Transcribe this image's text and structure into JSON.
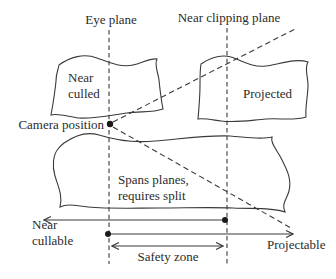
{
  "colors": {
    "background": "#ffffff",
    "line": "#3a3a3a",
    "text": "#2b2b2b"
  },
  "planes": {
    "eye": {
      "label": "Eye plane"
    },
    "near_clipping": {
      "label": "Near clipping plane"
    }
  },
  "camera": {
    "label": "Camera position"
  },
  "regions": {
    "near_culled": {
      "lines": [
        "Near",
        "culled"
      ]
    },
    "projected": {
      "label": "Projected"
    },
    "spans": {
      "lines": [
        "Spans planes,",
        "requires split"
      ]
    }
  },
  "ranges": {
    "near_cullable": {
      "lines": [
        "Near",
        "cullable"
      ]
    },
    "projectable": {
      "label": "Projectable"
    },
    "safety_zone": {
      "label": "Safety zone"
    }
  }
}
